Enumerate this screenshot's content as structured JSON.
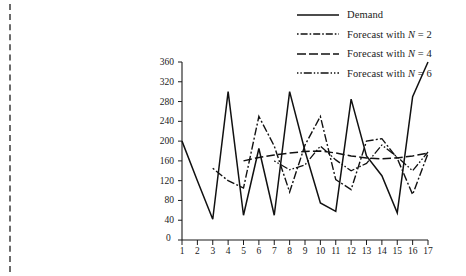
{
  "figure": {
    "title": "",
    "cut_mark": "dashed-trim-line"
  },
  "legend": {
    "position": "top-right",
    "items": [
      {
        "label": "Demand",
        "style": "solid",
        "name": "legend-demand"
      },
      {
        "label": "Forecast with N = 2",
        "style": "dash-dot",
        "name": "legend-forecast-n2"
      },
      {
        "label": "Forecast with N = 4",
        "style": "long-dash",
        "name": "legend-forecast-n4"
      },
      {
        "label": "Forecast with N = 6",
        "style": "dot-dash-dot",
        "name": "legend-forecast-n6"
      }
    ]
  },
  "axes": {
    "y_ticks": [
      0,
      40,
      80,
      120,
      160,
      200,
      240,
      280,
      320,
      360
    ],
    "x_ticks": [
      1,
      2,
      3,
      4,
      5,
      6,
      7,
      8,
      9,
      10,
      11,
      12,
      13,
      14,
      15,
      16,
      17
    ],
    "ylim": [
      0,
      360
    ],
    "xlim": [
      1,
      17
    ],
    "xlabel": "",
    "ylabel": ""
  },
  "chart_data": {
    "type": "line",
    "title": "",
    "xlabel": "",
    "ylabel": "",
    "xlim": [
      1,
      17
    ],
    "ylim": [
      0,
      360
    ],
    "grid": false,
    "legend_position": "top-right",
    "x": [
      1,
      2,
      3,
      4,
      5,
      6,
      7,
      8,
      9,
      10,
      11,
      12,
      13,
      14,
      15,
      16,
      17
    ],
    "series": [
      {
        "name": "Demand",
        "style": "solid",
        "values": [
          200,
          120,
          42,
          300,
          50,
          185,
          50,
          300,
          180,
          75,
          58,
          285,
          170,
          130,
          55,
          290,
          360
        ]
      },
      {
        "name": "Forecast with N = 2",
        "style": "dash-dot",
        "values": [
          null,
          null,
          145,
          120,
          105,
          250,
          190,
          97,
          192,
          250,
          122,
          102,
          200,
          205,
          165,
          92,
          175
        ]
      },
      {
        "name": "Forecast with N = 4",
        "style": "long-dash",
        "values": [
          null,
          null,
          null,
          null,
          160,
          167,
          172,
          176,
          179,
          180,
          176,
          170,
          166,
          164,
          166,
          170,
          176
        ]
      },
      {
        "name": "Forecast with N = 6",
        "style": "dot-dash-dot",
        "values": [
          null,
          null,
          null,
          null,
          null,
          null,
          160,
          142,
          152,
          190,
          162,
          140,
          155,
          192,
          168,
          140,
          178
        ]
      }
    ]
  }
}
